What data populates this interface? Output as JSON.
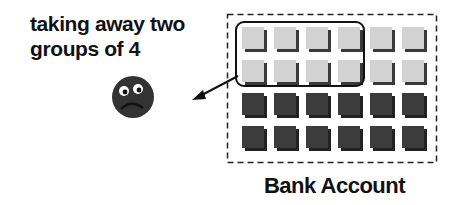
{
  "caption": {
    "line1": "taking away two",
    "line2": "groups of 4"
  },
  "account_label": "Bank Account",
  "tiles": {
    "columns": 6,
    "rows": [
      {
        "kind": "positive"
      },
      {
        "kind": "positive"
      },
      {
        "kind": "negative"
      },
      {
        "kind": "negative"
      }
    ],
    "circled_group": {
      "rows": [
        0,
        1
      ],
      "columns": 4
    },
    "positive_count": 12,
    "negative_count": 12,
    "removed_count": 8
  },
  "icons": {
    "face": "sad-face-icon",
    "arrow": "arrow-icon"
  },
  "colors": {
    "positive_tile": "#d2d2d2",
    "positive_shadow": "#3a3a3a",
    "negative_tile": "#3c3c3c",
    "negative_shadow": "#222222",
    "face": "#333333",
    "ink": "#111111"
  }
}
